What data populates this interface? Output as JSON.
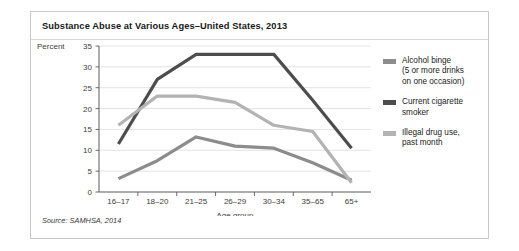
{
  "figure": {
    "title": "Substance Abuse at Various Ages–United States, 2013",
    "source": "Source: SAMHSA, 2014"
  },
  "chart_data": {
    "type": "line",
    "title": "Substance Abuse at Various Ages–United States, 2013",
    "xlabel": "Age group",
    "ylabel": "Percent",
    "ylim": [
      0,
      35
    ],
    "yticks": [
      0,
      5,
      10,
      15,
      20,
      25,
      30,
      35
    ],
    "grid": true,
    "legend_position": "right",
    "categories": [
      "16–17",
      "18–20",
      "21–25",
      "26–29",
      "30–34",
      "35–65",
      "65+"
    ],
    "series": [
      {
        "name": "Alcohol binge (5 or more drinks on one occasion)",
        "color": "#8c8c8c",
        "values": [
          3.2,
          7.5,
          13.2,
          11.0,
          10.5,
          7.0,
          2.8
        ]
      },
      {
        "name": "Current cigarette smoker",
        "color": "#4d4d4d",
        "values": [
          11.5,
          27.0,
          33.0,
          33.0,
          33.0,
          22.0,
          10.5
        ]
      },
      {
        "name": "Illegal drug use, past month",
        "color": "#b3b3b3",
        "values": [
          16.0,
          23.0,
          23.0,
          21.5,
          16.0,
          14.5,
          2.2
        ]
      }
    ]
  },
  "legend": {
    "items": [
      {
        "label": "Alcohol binge\n(5 or more drinks\non one occasion)",
        "color": "#8c8c8c"
      },
      {
        "label": "Current cigarette\nsmoker",
        "color": "#4d4d4d"
      },
      {
        "label": "Illegal drug use,\npast month",
        "color": "#b3b3b3"
      }
    ]
  }
}
